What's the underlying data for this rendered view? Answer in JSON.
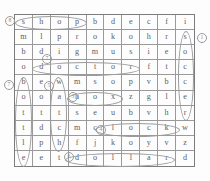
{
  "puzzle": {
    "type": "word-search",
    "rows": 10,
    "cols": 10,
    "grid": [
      [
        "s",
        "h",
        "o",
        "p",
        "b",
        "d",
        "e",
        "c",
        "f",
        "i"
      ],
      [
        "m",
        "l",
        "p",
        "r",
        "o",
        "k",
        "o",
        "h",
        "r",
        "s"
      ],
      [
        "b",
        "d",
        "i",
        "g",
        "m",
        "u",
        "s",
        "i",
        "e",
        "o"
      ],
      [
        "o",
        "d",
        "o",
        "c",
        "t",
        "o",
        "r",
        "f",
        "t",
        "c"
      ],
      [
        "b",
        "e",
        "w",
        "m",
        "s",
        "o",
        "p",
        "v",
        "b",
        "c"
      ],
      [
        "o",
        "o",
        "a",
        "h",
        "o",
        "x",
        "z",
        "g",
        "l",
        "e"
      ],
      [
        "t",
        "t",
        "t",
        "s",
        "e",
        "u",
        "b",
        "v",
        "h",
        "r"
      ],
      [
        "t",
        "d",
        "c",
        "m",
        "c",
        "l",
        "o",
        "c",
        "k",
        "w"
      ],
      [
        "l",
        "p",
        "h",
        "f",
        "j",
        "k",
        "o",
        "y",
        "v",
        "z"
      ],
      [
        "e",
        "e",
        "t",
        "d",
        "o",
        "l",
        "l",
        "a",
        "r",
        "d"
      ]
    ],
    "found_words": [
      {
        "word": "shop",
        "marker": "8",
        "direction": "horizontal",
        "row": 1,
        "col_start": 1,
        "col_end": 4
      },
      {
        "word": "soccer",
        "marker": "1",
        "direction": "vertical",
        "col": 10,
        "row_start": 2,
        "row_end": 7
      },
      {
        "word": "doctor",
        "marker": "2",
        "direction": "horizontal",
        "row": 4,
        "col_start": 2,
        "col_end": 7
      },
      {
        "word": "bottle",
        "marker": "7",
        "direction": "vertical",
        "col": 1,
        "row_start": 5,
        "row_end": 10
      },
      {
        "word": "watch",
        "marker": "5",
        "direction": "vertical",
        "col": 3,
        "row_start": 5,
        "row_end": 9
      },
      {
        "word": "box",
        "marker": "3",
        "direction": "horizontal",
        "row": 6,
        "col_start": 4,
        "col_end": 6
      },
      {
        "word": "clock",
        "marker": "4",
        "direction": "horizontal",
        "row": 8,
        "col_start": 5,
        "col_end": 9
      },
      {
        "word": "dollar",
        "marker": "6",
        "direction": "horizontal",
        "row": 10,
        "col_start": 4,
        "col_end": 9
      }
    ],
    "markers": [
      {
        "label": "8",
        "x": 5,
        "y": 16
      },
      {
        "label": "1",
        "x": 197,
        "y": 33
      },
      {
        "label": "7",
        "x": 42,
        "y": 54
      },
      {
        "label": "7",
        "x": 4,
        "y": 80
      },
      {
        "label": "5",
        "x": 44,
        "y": 81
      },
      {
        "label": "3",
        "x": 68,
        "y": 92
      },
      {
        "label": "4",
        "x": 96,
        "y": 125
      },
      {
        "label": "6",
        "x": 64,
        "y": 152
      }
    ]
  },
  "colors": {
    "grid_line": "#9a9a9a",
    "grid_border": "#7c7c7c",
    "letter": "#5d5d5d",
    "oval": "#9b9b9b",
    "background": "#fdfdfd"
  }
}
